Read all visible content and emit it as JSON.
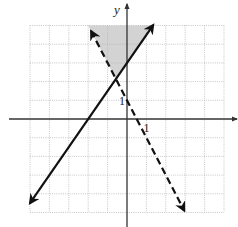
{
  "chart_data": {
    "type": "line",
    "title": "",
    "xlabel": "",
    "ylabel": "y",
    "xlim": [
      -5,
      5
    ],
    "ylim": [
      -5,
      5
    ],
    "grid": true,
    "tick_labels": [
      {
        "axis": "y",
        "value": 1,
        "text": "1"
      },
      {
        "axis": "x",
        "value": 1,
        "text": "1"
      }
    ],
    "series": [
      {
        "name": "solid boundary",
        "equation": "y = 1.5x + 3",
        "slope": 1.5,
        "intercept": 3,
        "style": "solid",
        "arrows": "both",
        "x_range": [
          -5,
          1.35
        ]
      },
      {
        "name": "dashed boundary",
        "equation": "y = -2x + 1",
        "slope": -2,
        "intercept": 1,
        "style": "dashed",
        "arrows": "both",
        "x_range": [
          -1.85,
          2.95
        ]
      }
    ],
    "shaded_region": {
      "description": "region above both lines, bounded at top by y = 5",
      "vertices": [
        [
          -2,
          5
        ],
        [
          -0.571,
          2.143
        ],
        [
          1.333,
          5
        ]
      ],
      "color": "#d3d3d3"
    },
    "colors": {
      "line": "#111111",
      "grid": "#b8b8b8",
      "axis": "#333333",
      "shade": "#d3d3d3"
    }
  }
}
